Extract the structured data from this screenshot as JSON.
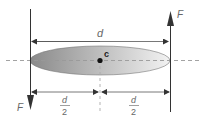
{
  "diagram": {
    "labels": {
      "force_top": "F",
      "force_bottom": "F",
      "distance_full": "d",
      "center": "c",
      "half_left_num": "d",
      "half_left_den": "2",
      "half_right_num": "d",
      "half_right_den": "2"
    },
    "colors": {
      "line": "#333333",
      "dash": "#999999",
      "body_dark": "#8a8a8a",
      "body_light": "#f2f2f2",
      "text": "#666666"
    }
  }
}
